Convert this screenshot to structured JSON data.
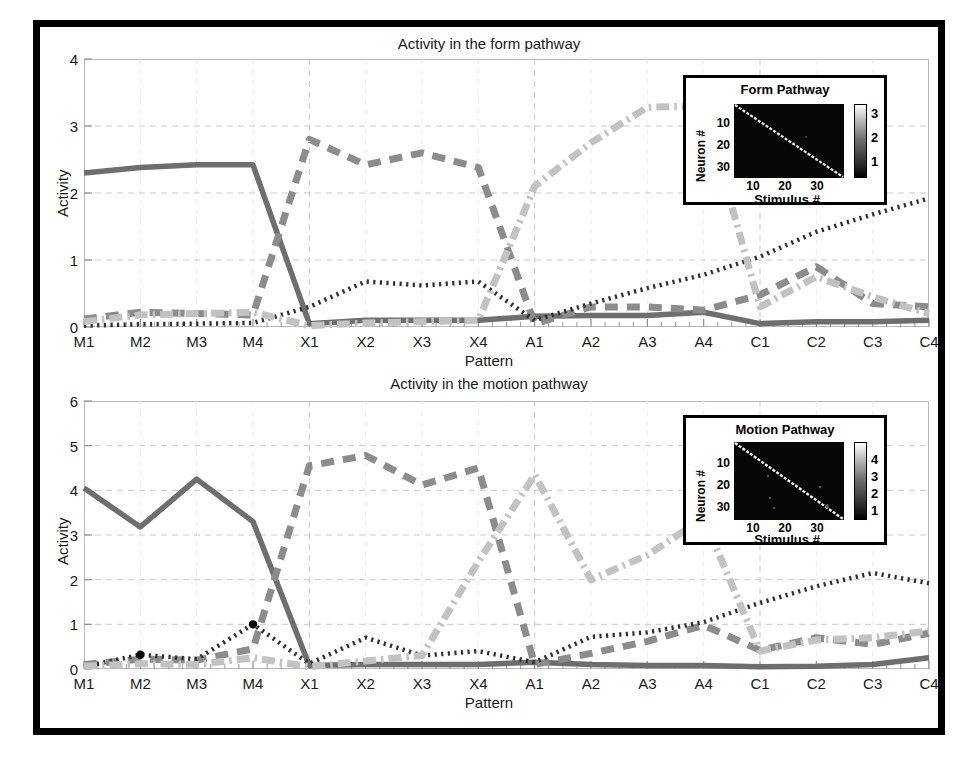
{
  "figure": {
    "background": "#ffffff",
    "frame_color": "#000000"
  },
  "chart_data": [
    {
      "type": "line",
      "id": "form-pathway",
      "title": "Activity in the form pathway",
      "xlabel": "Pattern",
      "ylabel": "Activity",
      "ylim": [
        0,
        4
      ],
      "yticks": [
        0,
        1,
        2,
        3,
        4
      ],
      "grid": true,
      "categories": [
        "M1",
        "M2",
        "M3",
        "M4",
        "X1",
        "X2",
        "X3",
        "X4",
        "A1",
        "A2",
        "A3",
        "A4",
        "C1",
        "C2",
        "C3",
        "C4"
      ],
      "x": [
        0,
        1,
        2,
        3,
        4,
        5,
        6,
        7,
        8,
        9,
        10,
        11,
        12,
        13,
        14,
        15
      ],
      "series": [
        {
          "name": "solid-dark",
          "style": "solid",
          "color": "#6e6e6e",
          "values": [
            2.3,
            2.38,
            2.42,
            2.42,
            0.05,
            0.1,
            0.1,
            0.1,
            0.16,
            0.17,
            0.17,
            0.22,
            0.05,
            0.08,
            0.08,
            0.1
          ]
        },
        {
          "name": "dashed-dark",
          "style": "dashed",
          "color": "#8c8c8c",
          "values": [
            0.12,
            0.22,
            0.2,
            0.18,
            2.8,
            2.42,
            2.6,
            2.38,
            0.05,
            0.3,
            0.3,
            0.25,
            0.48,
            0.9,
            0.35,
            0.3
          ]
        },
        {
          "name": "dotted-black",
          "style": "dotted",
          "color": "#303030",
          "values": [
            0.02,
            0.04,
            0.05,
            0.06,
            0.3,
            0.68,
            0.62,
            0.68,
            0.1,
            0.35,
            0.58,
            0.78,
            1.05,
            1.42,
            1.68,
            1.92
          ]
        },
        {
          "name": "dashdot-light",
          "style": "dashdot",
          "color": "#c2c2c2",
          "values": [
            0.08,
            0.18,
            0.2,
            0.22,
            0.02,
            0.06,
            0.08,
            0.1,
            2.1,
            2.75,
            3.28,
            3.3,
            0.3,
            0.75,
            0.45,
            0.2
          ]
        }
      ],
      "inset": {
        "title": "Form Pathway",
        "xlabel": "Stimulus #",
        "ylabel": "Neuron #",
        "xticks": [
          "10",
          "20",
          "30"
        ],
        "yticks": [
          "10",
          "20",
          "30"
        ],
        "colorbar_ticks": [
          "3",
          "2",
          "1"
        ],
        "colormap": "gray",
        "pattern": "diagonal"
      }
    },
    {
      "type": "line",
      "id": "motion-pathway",
      "title": "Activity in the motion pathway",
      "xlabel": "Pattern",
      "ylabel": "Activity",
      "ylim": [
        0,
        6
      ],
      "yticks": [
        0,
        1,
        2,
        3,
        4,
        5,
        6
      ],
      "grid": true,
      "categories": [
        "M1",
        "M2",
        "M3",
        "M4",
        "X1",
        "X2",
        "X3",
        "X4",
        "A1",
        "A2",
        "A3",
        "A4",
        "C1",
        "C2",
        "C3",
        "C4"
      ],
      "x": [
        0,
        1,
        2,
        3,
        4,
        5,
        6,
        7,
        8,
        9,
        10,
        11,
        12,
        13,
        14,
        15
      ],
      "series": [
        {
          "name": "solid-dark",
          "style": "solid",
          "color": "#6e6e6e",
          "values": [
            4.05,
            3.18,
            4.25,
            3.3,
            0.08,
            0.1,
            0.1,
            0.1,
            0.15,
            0.1,
            0.08,
            0.08,
            0.05,
            0.06,
            0.1,
            0.25
          ]
        },
        {
          "name": "dashed-dark",
          "style": "dashed",
          "color": "#8c8c8c",
          "values": [
            0.1,
            0.22,
            0.2,
            0.45,
            4.55,
            4.78,
            4.12,
            4.5,
            0.1,
            0.35,
            0.62,
            0.98,
            0.42,
            0.7,
            0.55,
            0.8
          ]
        },
        {
          "name": "dotted-black",
          "style": "dotted",
          "color": "#303030",
          "values": [
            0.05,
            0.32,
            0.22,
            1.0,
            0.12,
            0.7,
            0.3,
            0.4,
            0.15,
            0.72,
            0.82,
            1.05,
            1.48,
            1.85,
            2.15,
            1.92
          ],
          "markers": [
            {
              "x": 1,
              "y": 0.32
            },
            {
              "x": 3,
              "y": 1.0
            }
          ]
        },
        {
          "name": "dashdot-light",
          "style": "dashdot",
          "color": "#c2c2c2",
          "values": [
            0.06,
            0.12,
            0.1,
            0.25,
            0.05,
            0.18,
            0.3,
            2.4,
            4.35,
            2.0,
            2.55,
            3.38,
            0.4,
            0.65,
            0.7,
            0.85
          ]
        }
      ],
      "inset": {
        "title": "Motion Pathway",
        "xlabel": "Stimulus #",
        "ylabel": "Neuron #",
        "xticks": [
          "10",
          "20",
          "30"
        ],
        "yticks": [
          "10",
          "20",
          "30"
        ],
        "colorbar_ticks": [
          "4",
          "3",
          "2",
          "1"
        ],
        "colormap": "gray",
        "pattern": "diagonal"
      }
    }
  ]
}
